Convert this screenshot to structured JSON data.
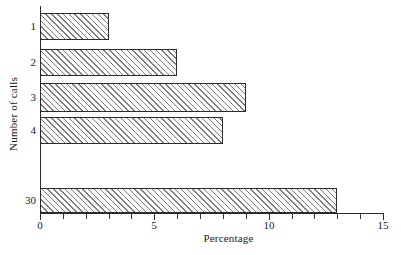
{
  "chart_data": {
    "type": "bar",
    "orientation": "horizontal",
    "title": "",
    "xlabel": "Percentage",
    "ylabel": "Number of calls",
    "categories": [
      "1",
      "2",
      "3",
      "4",
      "30"
    ],
    "values": [
      3,
      6,
      9,
      8,
      13
    ],
    "series": [
      {
        "name": "Percentage",
        "values": [
          3,
          6,
          9,
          8,
          13
        ]
      }
    ],
    "xlim": [
      0,
      15
    ],
    "xticks": [
      0,
      1,
      2,
      3,
      4,
      5,
      6,
      7,
      8,
      9,
      10,
      11,
      12,
      13,
      14,
      15
    ],
    "xtick_labels": [
      "0",
      "5",
      "10",
      "15"
    ],
    "labeled_xticks": [
      0,
      5,
      10,
      15
    ],
    "grid": false,
    "legend": false,
    "bar_fill": "hatched-diagonal",
    "bar_edge_color": "#2b2b2b",
    "bar_hatch_color": "#7c7c7c",
    "background": "#ffffff",
    "category_gap_after": "4"
  }
}
